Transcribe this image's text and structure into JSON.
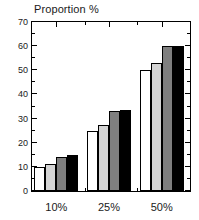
{
  "chart_data": {
    "type": "bar",
    "title": "Proportion %",
    "xlabel": "",
    "ylabel": "",
    "categories": [
      "10%",
      "25%",
      "50%"
    ],
    "ylim": [
      0,
      70
    ],
    "yticks": [
      0,
      10,
      20,
      30,
      40,
      50,
      60,
      70
    ],
    "ytick_labels": [
      "0",
      "10",
      "20",
      "30",
      "40",
      "50",
      "60",
      "70"
    ],
    "minor_tick_step": 5,
    "grid": false,
    "legend": "none",
    "series": [
      {
        "name": "series-1",
        "color": "#ffffff",
        "edge": "#000000",
        "values": [
          10,
          25,
          50
        ]
      },
      {
        "name": "series-2",
        "color": "#d4d4d4",
        "edge": "#000000",
        "values": [
          11.3,
          27.5,
          53
        ]
      },
      {
        "name": "series-3",
        "color": "#7f7f7f",
        "edge": "#000000",
        "values": [
          14,
          33,
          60
        ]
      },
      {
        "name": "series-4",
        "color": "#000000",
        "edge": "#000000",
        "values": [
          15,
          33.5,
          60
        ]
      }
    ]
  },
  "figure": {
    "background": "#ffffff",
    "axis_color": "#000000",
    "text_color": "#1a1a1a"
  }
}
